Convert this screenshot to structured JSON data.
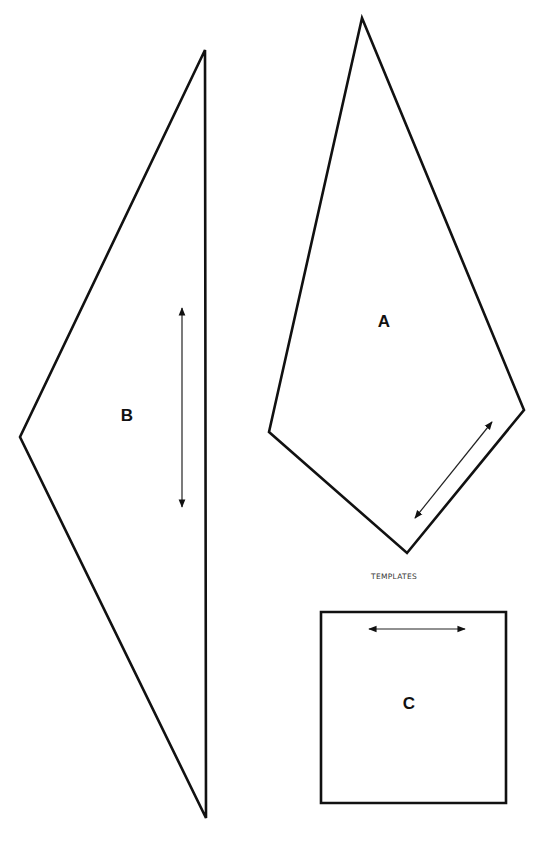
{
  "diagram": {
    "caption": "TEMPLATES",
    "colors": {
      "stroke": "#111111",
      "background": "#ffffff"
    },
    "templates": [
      {
        "id": "A",
        "label": "A",
        "shape": "kite",
        "vertices": [
          [
            362,
            18
          ],
          [
            524,
            410
          ],
          [
            407,
            553
          ],
          [
            269,
            432
          ]
        ],
        "label_pos": [
          384,
          323
        ],
        "grainline": {
          "from": [
            415,
            518
          ],
          "to": [
            492,
            422
          ],
          "direction": "diagonal-double-arrow"
        }
      },
      {
        "id": "B",
        "label": "B",
        "shape": "triangle",
        "vertices": [
          [
            205,
            50
          ],
          [
            206,
            818
          ],
          [
            20,
            437
          ]
        ],
        "label_pos": [
          127,
          417
        ],
        "grainline": {
          "from": [
            182,
            308
          ],
          "to": [
            182,
            507
          ],
          "direction": "vertical-double-arrow"
        }
      },
      {
        "id": "C",
        "label": "C",
        "shape": "square",
        "vertices": [
          [
            321,
            612
          ],
          [
            506,
            612
          ],
          [
            506,
            803
          ],
          [
            321,
            803
          ]
        ],
        "label_pos": [
          409,
          705
        ],
        "grainline": {
          "from": [
            369,
            629
          ],
          "to": [
            465,
            629
          ],
          "direction": "horizontal-double-arrow"
        }
      }
    ]
  }
}
